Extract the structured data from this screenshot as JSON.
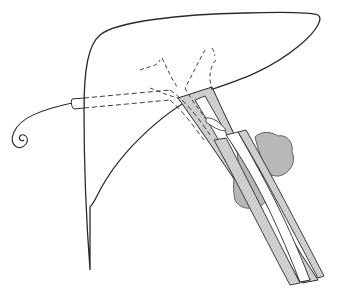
{
  "figure": {
    "title": "Liver with percutaneous transhepatic biliary drainage catheter and bile duct with tumor masses",
    "colors": {
      "outline": "#2a2a2a",
      "duct_fill": "#cfcfcf",
      "tumor_fill": "#b8b8b8",
      "background": "#ffffff"
    },
    "parts": [
      {
        "id": "liver",
        "label": "Liver outline"
      },
      {
        "id": "catheter",
        "label": "Drainage catheter (pigtail)"
      },
      {
        "id": "intrahepatic-ducts",
        "label": "Intrahepatic bile ducts (dashed)"
      },
      {
        "id": "common-bile-duct",
        "label": "Common bile duct"
      },
      {
        "id": "tumor",
        "label": "Tumor masses"
      }
    ]
  }
}
